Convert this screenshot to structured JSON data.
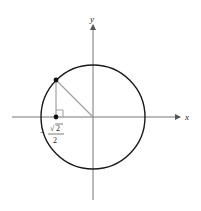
{
  "diagram": {
    "type": "unit-circle",
    "axes": {
      "x_label": "x",
      "y_label": "y"
    },
    "point": {
      "x": "-√2/2",
      "y": "√2/2",
      "angle_deg": 135
    },
    "labels": {
      "minus": "−",
      "sqrt_symbol": "√",
      "radicand": "2",
      "denominator": "2"
    },
    "colors": {
      "circle": "#1a1a1a",
      "axes": "#777777",
      "segments": "#a0a0a0",
      "point": "#111111"
    }
  }
}
